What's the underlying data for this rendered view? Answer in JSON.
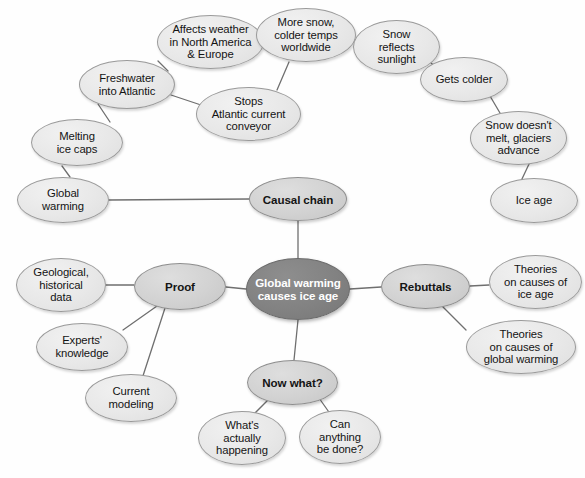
{
  "diagram": {
    "type": "mind-map",
    "colors": {
      "center_fill": "#828282",
      "center_text": "#ffffff",
      "branch_fill": "#d2d2d2",
      "leaf_fill": "#e8e8e8",
      "outline": "#9a9a9a",
      "edge": "#6f6f6f",
      "background": "#fefefe"
    },
    "nodes": [
      {
        "id": "center",
        "label": "Global warming\ncauses ice age",
        "kind": "center",
        "x": 246,
        "y": 258,
        "w": 104,
        "h": 62
      },
      {
        "id": "causal",
        "label": "Causal chain",
        "kind": "branch",
        "x": 249,
        "y": 177,
        "w": 98,
        "h": 44
      },
      {
        "id": "proof",
        "label": "Proof",
        "kind": "branch",
        "x": 134,
        "y": 263,
        "w": 92,
        "h": 47
      },
      {
        "id": "rebuttals",
        "label": "Rebuttals",
        "kind": "branch",
        "x": 381,
        "y": 264,
        "w": 89,
        "h": 45
      },
      {
        "id": "nowwhat",
        "label": "Now what?",
        "kind": "branch",
        "x": 247,
        "y": 360,
        "w": 91,
        "h": 45
      },
      {
        "id": "globalwarming",
        "label": "Global\nwarming",
        "kind": "leaf",
        "x": 17,
        "y": 177,
        "w": 92,
        "h": 46
      },
      {
        "id": "meltingice",
        "label": "Melting\nice caps",
        "kind": "leaf",
        "x": 31,
        "y": 119,
        "w": 92,
        "h": 47
      },
      {
        "id": "freshwater",
        "label": "Freshwater\ninto Atlantic",
        "kind": "leaf",
        "x": 79,
        "y": 60,
        "w": 96,
        "h": 49
      },
      {
        "id": "affects",
        "label": "Affects weather\nin North America\n& Europe",
        "kind": "leaf",
        "x": 157,
        "y": 15,
        "w": 107,
        "h": 54
      },
      {
        "id": "stops",
        "label": "Stops\nAtlantic current\nconveyor",
        "kind": "leaf",
        "x": 196,
        "y": 87,
        "w": 105,
        "h": 54
      },
      {
        "id": "moresnow",
        "label": "More snow,\ncolder temps\nworldwide",
        "kind": "leaf",
        "x": 256,
        "y": 8,
        "w": 100,
        "h": 54
      },
      {
        "id": "snowreflects",
        "label": "Snow\nreflects\nsunlight",
        "kind": "leaf",
        "x": 353,
        "y": 20,
        "w": 87,
        "h": 54
      },
      {
        "id": "getscolder",
        "label": "Gets colder",
        "kind": "leaf",
        "x": 420,
        "y": 57,
        "w": 88,
        "h": 45
      },
      {
        "id": "snowdoesnt",
        "label": "Snow doesn't\nmelt, glaciers\nadvance",
        "kind": "leaf",
        "x": 470,
        "y": 111,
        "w": 97,
        "h": 54
      },
      {
        "id": "iceage",
        "label": "Ice age",
        "kind": "leaf",
        "x": 490,
        "y": 178,
        "w": 88,
        "h": 45
      },
      {
        "id": "geological",
        "label": "Geological,\nhistorical\ndata",
        "kind": "leaf",
        "x": 16,
        "y": 258,
        "w": 90,
        "h": 54
      },
      {
        "id": "experts",
        "label": "Experts'\nknowledge",
        "kind": "leaf",
        "x": 36,
        "y": 323,
        "w": 92,
        "h": 48
      },
      {
        "id": "modeling",
        "label": "Current\nmodeling",
        "kind": "leaf",
        "x": 85,
        "y": 374,
        "w": 92,
        "h": 48
      },
      {
        "id": "whatsactually",
        "label": "What's\nactually\nhappening",
        "kind": "leaf",
        "x": 198,
        "y": 411,
        "w": 88,
        "h": 54
      },
      {
        "id": "cananything",
        "label": "Can\nanything\nbe done?",
        "kind": "leaf",
        "x": 299,
        "y": 410,
        "w": 82,
        "h": 54
      },
      {
        "id": "theoriesice",
        "label": "Theories\non causes of\nice age",
        "kind": "leaf",
        "x": 489,
        "y": 255,
        "w": 93,
        "h": 54
      },
      {
        "id": "theorieswarm",
        "label": "Theories\non causes of\nglobal warming",
        "kind": "leaf",
        "x": 466,
        "y": 320,
        "w": 110,
        "h": 54
      }
    ],
    "edges": [
      {
        "from": "center",
        "to": "causal",
        "x1": 298,
        "y1": 258,
        "x2": 298,
        "y2": 221
      },
      {
        "from": "center",
        "to": "proof",
        "x1": 246,
        "y1": 289,
        "x2": 226,
        "y2": 287
      },
      {
        "from": "center",
        "to": "rebuttals",
        "x1": 350,
        "y1": 289,
        "x2": 381,
        "y2": 287
      },
      {
        "from": "center",
        "to": "nowwhat",
        "x1": 298,
        "y1": 320,
        "x2": 294,
        "y2": 360
      },
      {
        "from": "causal",
        "to": "globalwarming",
        "x1": 249,
        "y1": 199,
        "x2": 109,
        "y2": 200
      },
      {
        "from": "globalwarming",
        "to": "meltingice",
        "x1": 70,
        "y1": 177,
        "x2": 62,
        "y2": 166
      },
      {
        "from": "meltingice",
        "to": "freshwater",
        "x1": 110,
        "y1": 122,
        "x2": 98,
        "y2": 104
      },
      {
        "from": "freshwater",
        "to": "affects",
        "x1": 168,
        "y1": 71,
        "x2": 158,
        "y2": 61
      },
      {
        "from": "freshwater",
        "to": "stops",
        "x1": 171,
        "y1": 95,
        "x2": 201,
        "y2": 105
      },
      {
        "from": "affects",
        "to": "moresnow",
        "x1": 262,
        "y1": 40,
        "x2": 277,
        "y2": 40
      },
      {
        "from": "stops",
        "to": "moresnow",
        "x1": 277,
        "y1": 90,
        "x2": 289,
        "y2": 62
      },
      {
        "from": "moresnow",
        "to": "snowreflects",
        "x1": 352,
        "y1": 40,
        "x2": 368,
        "y2": 41
      },
      {
        "from": "snowreflects",
        "to": "getscolder",
        "x1": 430,
        "y1": 62,
        "x2": 443,
        "y2": 74
      },
      {
        "from": "getscolder",
        "to": "snowdoesnt",
        "x1": 490,
        "y1": 96,
        "x2": 500,
        "y2": 113
      },
      {
        "from": "snowdoesnt",
        "to": "iceage",
        "x1": 530,
        "y1": 162,
        "x2": 521,
        "y2": 181
      },
      {
        "from": "proof",
        "to": "geological",
        "x1": 134,
        "y1": 285,
        "x2": 106,
        "y2": 285
      },
      {
        "from": "proof",
        "to": "experts",
        "x1": 157,
        "y1": 306,
        "x2": 123,
        "y2": 330
      },
      {
        "from": "proof",
        "to": "modeling",
        "x1": 165,
        "y1": 308,
        "x2": 141,
        "y2": 382
      },
      {
        "from": "rebuttals",
        "to": "theoriesice",
        "x1": 470,
        "y1": 286,
        "x2": 489,
        "y2": 285
      },
      {
        "from": "rebuttals",
        "to": "theorieswarm",
        "x1": 442,
        "y1": 306,
        "x2": 466,
        "y2": 330
      },
      {
        "from": "nowwhat",
        "to": "whatsactually",
        "x1": 268,
        "y1": 400,
        "x2": 252,
        "y2": 416
      },
      {
        "from": "nowwhat",
        "to": "cananything",
        "x1": 319,
        "y1": 398,
        "x2": 331,
        "y2": 415
      }
    ]
  }
}
